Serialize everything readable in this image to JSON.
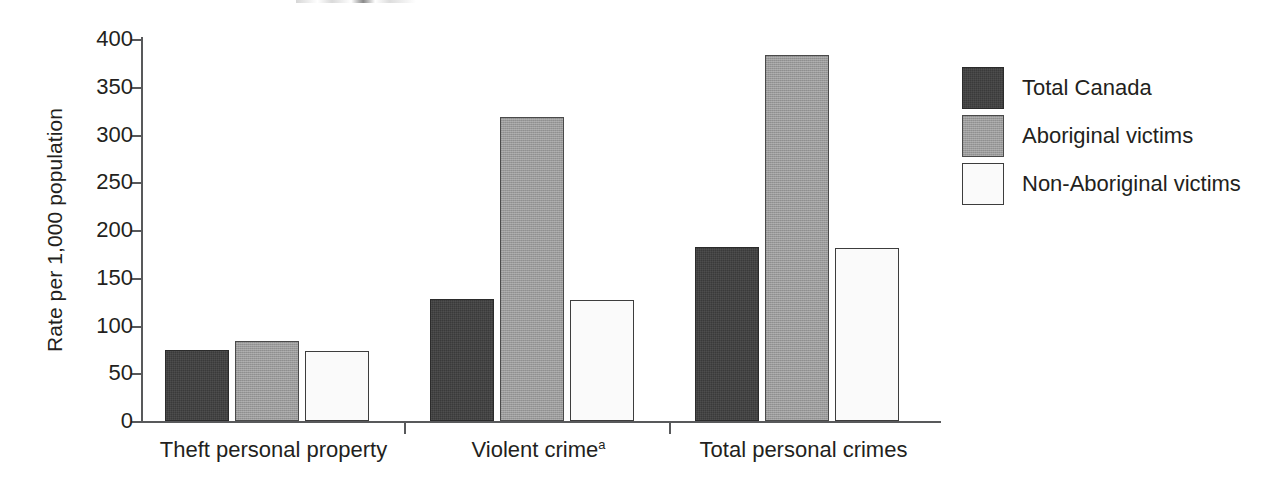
{
  "chart_data": {
    "type": "bar",
    "title": "",
    "xlabel": "",
    "ylabel": "Rate per 1,000 population",
    "ylim": [
      0,
      400
    ],
    "ytick_values": [
      0,
      50,
      100,
      150,
      200,
      250,
      300,
      350,
      400
    ],
    "ytick_labels": [
      "0",
      "50",
      "100",
      "150",
      "200",
      "250",
      "300",
      "350",
      "400"
    ],
    "grid": false,
    "legend_position": "right",
    "categories": [
      "Theft personal property",
      "Violent crime",
      "Total personal crimes"
    ],
    "category_footnotes": [
      "",
      "a",
      ""
    ],
    "series": [
      {
        "name": "Total Canada",
        "color": "#3a3a3a",
        "values": [
          74,
          128,
          182
        ]
      },
      {
        "name": "Aboriginal victims",
        "color": "#9a9a9a",
        "values": [
          84,
          318,
          383
        ]
      },
      {
        "name": "Non-Aboriginal victims",
        "color": "#fafafa",
        "values": [
          73,
          127,
          181
        ]
      }
    ],
    "annotations": []
  },
  "axis": {
    "y_title": "Rate per 1,000 population"
  },
  "legend": {
    "items": [
      {
        "label": "Total Canada"
      },
      {
        "label": "Aboriginal victims"
      },
      {
        "label": "Non-Aboriginal victims"
      }
    ]
  }
}
